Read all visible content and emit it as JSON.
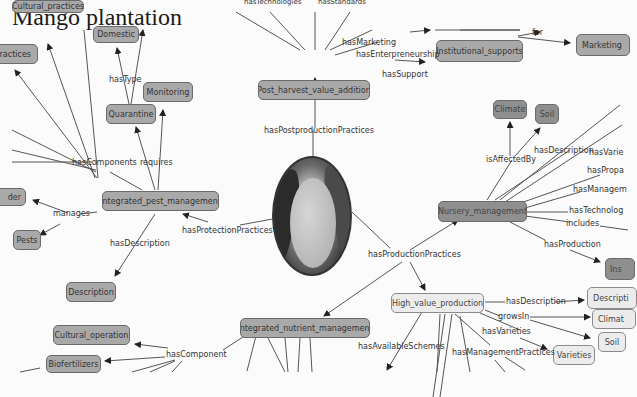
{
  "title": "Mango plantation",
  "colors": {
    "node_fill": "#a9a9a9",
    "node_light_fill": "#ececec",
    "node_border": "#6a6a6a",
    "edge": "#555555"
  },
  "center_image": {
    "subject": "mango-fruit-photo"
  },
  "nodes": {
    "cultural_practices_top": "Cultural_practices",
    "practices": "ractices",
    "domestic": "Domestic",
    "monitoring": "Monitoring",
    "quarantine": "Quarantine",
    "post_harvest": "Post_harvest_value_addition",
    "institutional": "Institutional_supports",
    "marketing": "Marketing",
    "climate_top": "Climate",
    "soil_top": "Soil",
    "integrated_pest": "Integrated_pest_management",
    "nursery": "Nursery_management",
    "der": "der",
    "pests": "Pests",
    "ins": "Ins",
    "description_left": "Description",
    "integrated_nutrient": "Integrated_nutrient_management",
    "high_value": "High_value_production",
    "description_right": "Descripti",
    "climate_right": "Climat",
    "soil_right": "Soil",
    "varieties": "Varieties",
    "cultural_operation": "Cultural_operation",
    "biofertilizers": "Biofertilizers"
  },
  "edge_labels": {
    "hasTechnologies": "hasTechnologies",
    "hasStandards": "hasStandards",
    "hasMarketing": "hasMarketing",
    "hasEnterpreneurship": "hasEnterpreneurship",
    "hasSupport": "hasSupport",
    "for": "for",
    "hasType": "hasType",
    "hasPostproductionPractices": "hasPostproductionPractices",
    "hasComponents": "hasComponents",
    "requires": "requires",
    "isAffectedBy": "isAffectedBy",
    "hasDescription_n": "hasDescription",
    "hasVarie": "hasVarie",
    "hasPropa": "hasPropa",
    "hasManagem": "hasManagem",
    "hasTechnolog": "hasTechnolog",
    "includes": "includes",
    "hasProduction": "hasProduction",
    "manages": "manages",
    "hasProtectionPractices": "hasProtectionPractices",
    "hasDescription_l": "hasDescription",
    "hasProductionPractices": "hasProductionPractices",
    "hasDescription_h": "hasDescription",
    "growsIn": "growsIn",
    "hasVarieties": "hasVarieties",
    "hasAvailableSchemes": "hasAvailableSchemes",
    "hasManagementPractices": "hasManagementPractices",
    "hasComponent": "hasComponent"
  }
}
